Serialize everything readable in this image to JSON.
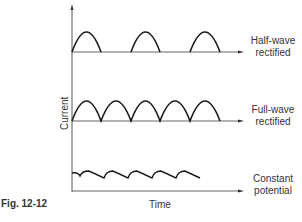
{
  "figure": {
    "caption": "Fig. 12-12",
    "x_axis_label": "Time",
    "y_axis_label": "Current",
    "traces": [
      {
        "id": "half",
        "line1": "Half-wave",
        "line2": "rectified"
      },
      {
        "id": "full",
        "line1": "Full-wave",
        "line2": "rectified"
      },
      {
        "id": "constant",
        "line1": "Constant",
        "line2": "potential"
      }
    ]
  },
  "colors": {
    "line": "#1a1a1a",
    "axis": "#555555",
    "background": "#ffffff"
  }
}
